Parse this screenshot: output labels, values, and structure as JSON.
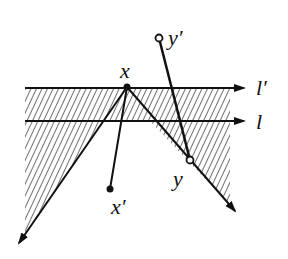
{
  "diagram": {
    "labels": {
      "x": "x",
      "x_prime": "x′",
      "y": "y",
      "y_prime": "y′",
      "l": "l",
      "l_prime": "l′"
    },
    "points": {
      "x": {
        "cx": 127,
        "cy": 87,
        "style": "filled"
      },
      "x_prime": {
        "cx": 110,
        "cy": 189,
        "style": "filled"
      },
      "y": {
        "cx": 190,
        "cy": 160,
        "style": "hollow"
      },
      "y_prime": {
        "cx": 159,
        "cy": 38,
        "style": "hollow"
      }
    },
    "lines": {
      "l_prime": {
        "y": 88,
        "x_start": 25,
        "x_end": 246
      },
      "l": {
        "y": 121,
        "x_start": 25,
        "x_end": 246
      }
    },
    "rays": {
      "left": {
        "from": [
          127,
          87
        ],
        "to": [
          18,
          245
        ]
      },
      "right": {
        "from": [
          127,
          87
        ],
        "to": [
          236,
          213
        ]
      }
    },
    "colors": {
      "ink": "#111111",
      "background": "#ffffff"
    }
  }
}
